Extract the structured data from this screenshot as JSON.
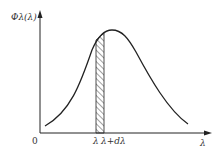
{
  "diagram": {
    "y_axis_label": "Φλ(λ)",
    "x_axis_label": "λ",
    "origin_label": "0",
    "strip_label_left": "λ",
    "strip_label_right": "λ+dλ",
    "colors": {
      "line": "#222222",
      "hatch": "#444444",
      "background": "#ffffff"
    }
  }
}
